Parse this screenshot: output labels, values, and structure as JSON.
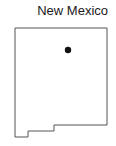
{
  "map": {
    "title": "New Mexico",
    "outline_color": "#555555",
    "marker_color": "#111111",
    "marker": {
      "cx": 68,
      "cy": 50,
      "r": 3.2
    },
    "outline_points": "15,28 107,28 107,125 54,125 54,131 28,131 28,137 15,137 15,28"
  }
}
